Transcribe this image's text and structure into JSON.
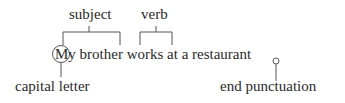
{
  "diagram": {
    "sentence": "My brother works at a restaurant.",
    "sentence_display": "My brother works at a restaurant",
    "labels": {
      "subject": "subject",
      "verb": "verb",
      "capital_letter": "capital letter",
      "end_punctuation": "end punctuation"
    },
    "colors": {
      "text": "#2a2a2a",
      "lines": "#555555"
    }
  }
}
